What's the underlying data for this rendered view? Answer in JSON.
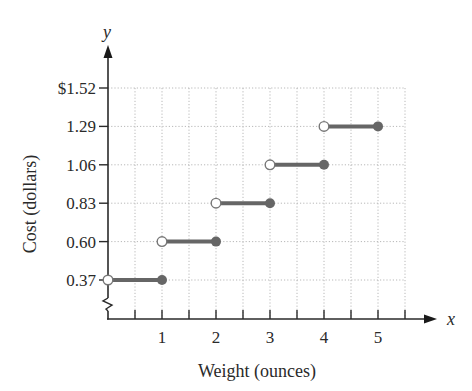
{
  "chart_data": {
    "type": "line",
    "subtype": "step-function",
    "title": "",
    "xlabel": "Weight (ounces)",
    "ylabel": "Cost (dollars)",
    "x_axis_var": "x",
    "y_axis_var": "y",
    "x_ticks": [
      1,
      2,
      3,
      4,
      5
    ],
    "x_tick_labels": [
      "1",
      "2",
      "3",
      "4",
      "5"
    ],
    "x_minor_tick_step": 0.5,
    "xlim": [
      0,
      5.5
    ],
    "y_ticks": [
      0.37,
      0.6,
      0.83,
      1.06,
      1.29,
      1.52
    ],
    "y_tick_labels": [
      "0.37",
      "0.60",
      "0.83",
      "1.06",
      "1.29",
      "$1.52"
    ],
    "y_axis_break": true,
    "grid": true,
    "grid_style": "dotted",
    "series": [
      {
        "name": "Postage cost",
        "color": "#666666",
        "segments": [
          {
            "x_start": 0,
            "x_end": 1,
            "y": 0.37,
            "start_open": true,
            "end_closed": true
          },
          {
            "x_start": 1,
            "x_end": 2,
            "y": 0.6,
            "start_open": true,
            "end_closed": true
          },
          {
            "x_start": 2,
            "x_end": 3,
            "y": 0.83,
            "start_open": true,
            "end_closed": true
          },
          {
            "x_start": 3,
            "x_end": 4,
            "y": 1.06,
            "start_open": true,
            "end_closed": true
          },
          {
            "x_start": 4,
            "x_end": 5,
            "y": 1.29,
            "start_open": true,
            "end_closed": true
          }
        ]
      }
    ]
  },
  "colors": {
    "axis": "#2a2a2a",
    "grid": "#b8b8b8",
    "series": "#666666",
    "open_fill": "#ffffff"
  }
}
